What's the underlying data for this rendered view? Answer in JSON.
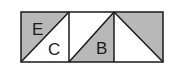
{
  "diagram": {
    "type": "geometry-squares",
    "colors": {
      "stroke": "#1a1a1a",
      "shade": "#b8b8b8",
      "background": "#ffffff"
    },
    "squares": [
      {
        "index": 1,
        "diagonal": "bottom-left-to-top-right",
        "shaded": "upper-left",
        "labels": [
          "E",
          "C"
        ]
      },
      {
        "index": 2,
        "diagonal": "bottom-left-to-top-right",
        "shaded": "lower-right",
        "labels": [
          "B"
        ]
      },
      {
        "index": 3,
        "diagonal": "top-left-to-bottom-right",
        "shaded": "upper-right",
        "labels": []
      }
    ],
    "labels": {
      "E": "E",
      "C": "C",
      "B": "B"
    }
  }
}
